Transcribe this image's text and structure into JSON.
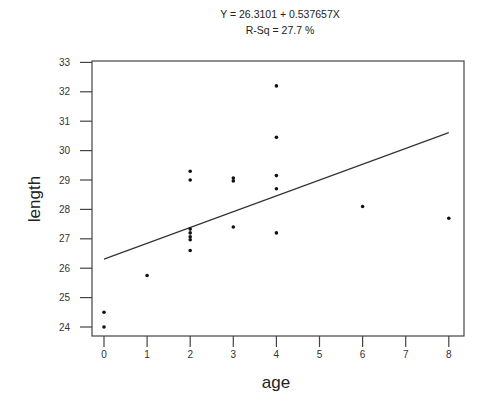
{
  "chart_data": {
    "type": "scatter",
    "title": "Y = 26.3101 + 0.537657X",
    "subtitle": "R-Sq = 27.7 %",
    "xlabel": "age",
    "ylabel": "length",
    "xlim": [
      0,
      8
    ],
    "ylim": [
      24,
      33
    ],
    "x_ticks": [
      0,
      1,
      2,
      3,
      4,
      5,
      6,
      7,
      8
    ],
    "y_ticks": [
      24,
      25,
      26,
      27,
      28,
      29,
      30,
      31,
      32,
      33
    ],
    "grid": false,
    "legend": null,
    "fit_line": {
      "intercept": 26.3101,
      "slope": 0.537657,
      "x_range": [
        0,
        8
      ]
    },
    "points": [
      {
        "x": 0,
        "y": 24.5
      },
      {
        "x": 0,
        "y": 24.0
      },
      {
        "x": 1,
        "y": 25.75
      },
      {
        "x": 2,
        "y": 29.3
      },
      {
        "x": 2,
        "y": 29.0
      },
      {
        "x": 2,
        "y": 27.33
      },
      {
        "x": 2,
        "y": 27.2
      },
      {
        "x": 2,
        "y": 27.07
      },
      {
        "x": 2,
        "y": 26.97
      },
      {
        "x": 2,
        "y": 26.6
      },
      {
        "x": 3,
        "y": 29.07
      },
      {
        "x": 3,
        "y": 28.97
      },
      {
        "x": 3,
        "y": 27.4
      },
      {
        "x": 4,
        "y": 32.2
      },
      {
        "x": 4,
        "y": 30.45
      },
      {
        "x": 4,
        "y": 29.15
      },
      {
        "x": 4,
        "y": 28.7
      },
      {
        "x": 4,
        "y": 27.2
      },
      {
        "x": 6,
        "y": 28.1
      },
      {
        "x": 8,
        "y": 27.7
      }
    ]
  }
}
